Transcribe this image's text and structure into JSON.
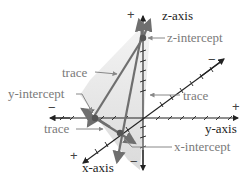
{
  "diagram": {
    "axes": {
      "z": {
        "label": "z-axis",
        "positive": "+",
        "negative": "−"
      },
      "y": {
        "label": "y-axis",
        "positive": "+",
        "negative": "−"
      },
      "x": {
        "label": "x-axis",
        "positive": "+",
        "negative": "−"
      }
    },
    "annotations": {
      "z_intercept": "z-intercept",
      "y_intercept": "y-intercept",
      "x_intercept": "x-intercept",
      "trace_1": "trace",
      "trace_2": "trace",
      "trace_3": "trace"
    },
    "colors": {
      "plane": "#d9d9d9",
      "trace": "#6f6f6f",
      "axis": "#222222",
      "label_gray": "#7a7a7a"
    }
  }
}
